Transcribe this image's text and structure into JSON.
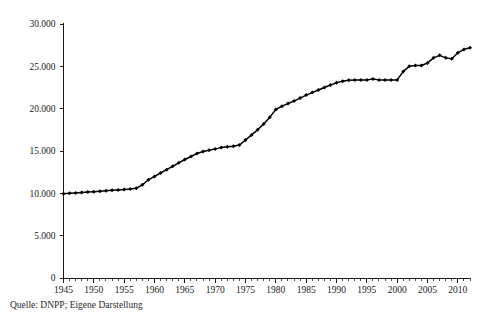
{
  "source_note": "Quelle: DNPP; Eigene Darstellung",
  "chart_data": {
    "type": "line",
    "title": "",
    "subtitle": "",
    "xlabel": "",
    "ylabel": "",
    "xlim": [
      1945,
      2012
    ],
    "ylim": [
      0,
      30000
    ],
    "grid": false,
    "legend": false,
    "legend_position": "none",
    "marker": "diamond",
    "line_color": "#000000",
    "number_format": "de-DE (period as thousands separator)",
    "y_ticks": [
      0,
      5000,
      10000,
      15000,
      20000,
      25000,
      30000
    ],
    "y_tick_labels": [
      "0",
      "5.000",
      "10.000",
      "15.000",
      "20.000",
      "25.000",
      "30.000"
    ],
    "x_ticks": [
      1945,
      1950,
      1955,
      1960,
      1965,
      1970,
      1975,
      1980,
      1985,
      1990,
      1995,
      2000,
      2005,
      2010
    ],
    "x_tick_labels": [
      "1945",
      "1950",
      "1955",
      "1960",
      "1965",
      "1970",
      "1975",
      "1980",
      "1985",
      "1990",
      "1995",
      "2000",
      "2005",
      "2010"
    ],
    "x_minor_tick_interval": 1,
    "x": [
      1945,
      1946,
      1947,
      1948,
      1949,
      1950,
      1951,
      1952,
      1953,
      1954,
      1955,
      1956,
      1957,
      1958,
      1959,
      1960,
      1961,
      1962,
      1963,
      1964,
      1965,
      1966,
      1967,
      1968,
      1969,
      1970,
      1971,
      1972,
      1973,
      1974,
      1975,
      1976,
      1977,
      1978,
      1979,
      1980,
      1981,
      1982,
      1983,
      1984,
      1985,
      1986,
      1987,
      1988,
      1989,
      1990,
      1991,
      1992,
      1993,
      1994,
      1995,
      1996,
      1997,
      1998,
      1999,
      2000,
      2001,
      2002,
      2003,
      2004,
      2005,
      2006,
      2007,
      2008,
      2009,
      2010,
      2011,
      2012
    ],
    "values": [
      9950,
      10000,
      10050,
      10100,
      10150,
      10200,
      10250,
      10300,
      10350,
      10400,
      10450,
      10500,
      10600,
      11000,
      11600,
      12000,
      12400,
      12800,
      13200,
      13600,
      14000,
      14350,
      14700,
      14950,
      15100,
      15250,
      15400,
      15500,
      15550,
      15700,
      16300,
      16900,
      17500,
      18200,
      19000,
      19900,
      20300,
      20600,
      20900,
      21250,
      21600,
      21900,
      22200,
      22500,
      22800,
      23050,
      23250,
      23350,
      23400,
      23400,
      23400,
      23500,
      23400,
      23400,
      23400,
      23400,
      24400,
      25000,
      25100,
      25100,
      25400,
      26000,
      26300,
      26000,
      25900,
      26600,
      27000,
      27200
    ],
    "series": [
      {
        "name": "Bestand",
        "values": [
          9950,
          10000,
          10050,
          10100,
          10150,
          10200,
          10250,
          10300,
          10350,
          10400,
          10450,
          10500,
          10600,
          11000,
          11600,
          12000,
          12400,
          12800,
          13200,
          13600,
          14000,
          14350,
          14700,
          14950,
          15100,
          15250,
          15400,
          15500,
          15550,
          15700,
          16300,
          16900,
          17500,
          18200,
          19000,
          19900,
          20300,
          20600,
          20900,
          21250,
          21600,
          21900,
          22200,
          22500,
          22800,
          23050,
          23250,
          23350,
          23400,
          23400,
          23400,
          23500,
          23400,
          23400,
          23400,
          23400,
          24400,
          25000,
          25100,
          25100,
          25400,
          26000,
          26300,
          26000,
          25900,
          26600,
          27000,
          27200
        ]
      }
    ]
  }
}
